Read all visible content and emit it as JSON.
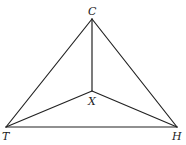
{
  "diagram": {
    "type": "triangle with interior point",
    "points": {
      "C": {
        "label": "C",
        "x": 92,
        "y": 19
      },
      "X": {
        "label": "X",
        "x": 92,
        "y": 91
      },
      "T": {
        "label": "T",
        "x": 6,
        "y": 127
      },
      "H": {
        "label": "H",
        "x": 177,
        "y": 127
      }
    },
    "segments": [
      "CT",
      "CH",
      "TH",
      "CX",
      "TX",
      "HX"
    ],
    "stroke_color": "#222222"
  }
}
